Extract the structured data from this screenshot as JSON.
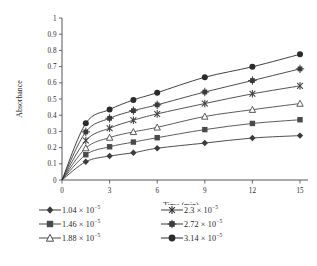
{
  "chart_data": {
    "type": "line",
    "title": "",
    "xlabel": "Time (min)",
    "ylabel": "Absorbance",
    "xlim": [
      0,
      15
    ],
    "ylim": [
      0,
      1
    ],
    "xticks": [
      "0",
      "3",
      "6",
      "9",
      "12",
      "15"
    ],
    "xtick_values": [
      0,
      3,
      6,
      9,
      12,
      15
    ],
    "yticks": [
      "0",
      "0.1",
      "0.2",
      "0.3",
      "0.4",
      "0.5",
      "0.6",
      "0.7",
      "0.8",
      "0.9",
      "1"
    ],
    "ytick_values": [
      0,
      0.1,
      0.2,
      0.3,
      0.4,
      0.5,
      0.6,
      0.7,
      0.8,
      0.9,
      1
    ],
    "grid": false,
    "legend_position": "below",
    "x": [
      0,
      1.5,
      3,
      4.5,
      6,
      9,
      12,
      15
    ],
    "series": [
      {
        "name": "1.04 × 10⁻⁵",
        "label_mantissa": "1.04 × 10",
        "label_exponent": "−5",
        "marker": "filled-diamond",
        "color": "#3b3b3b",
        "values": [
          0,
          0.113,
          0.148,
          0.168,
          0.196,
          0.228,
          0.259,
          0.274
        ]
      },
      {
        "name": "1.46 × 10⁻⁵",
        "label_mantissa": "1.46 × 10",
        "label_exponent": "−5",
        "marker": "filled-square",
        "color": "#4a4a4a",
        "values": [
          0,
          0.156,
          0.205,
          0.234,
          0.261,
          0.311,
          0.349,
          0.372
        ]
      },
      {
        "name": "1.88 × 10⁻⁵",
        "label_mantissa": "1.88 × 10",
        "label_exponent": "−5",
        "marker": "open-triangle",
        "color": "#4a4a4a",
        "values": [
          0,
          0.197,
          0.262,
          0.297,
          0.325,
          0.392,
          0.434,
          0.472
        ]
      },
      {
        "name": "2.3 × 10⁻⁵",
        "label_mantissa": "2.3 × 10",
        "label_exponent": "−5",
        "marker": "cross-star",
        "color": "#3f3f3f",
        "values": [
          0,
          0.244,
          0.32,
          0.369,
          0.408,
          0.472,
          0.532,
          0.581
        ]
      },
      {
        "name": "2.72 × 10⁻⁵",
        "label_mantissa": "2.72 × 10",
        "label_exponent": "−5",
        "marker": "square-star",
        "color": "#3a3a3a",
        "values": [
          0,
          0.297,
          0.381,
          0.428,
          0.464,
          0.543,
          0.614,
          0.686
        ]
      },
      {
        "name": "3.14 × 10⁻⁵",
        "label_mantissa": "3.14 × 10",
        "label_exponent": "−5",
        "marker": "filled-circle",
        "color": "#2b2b2b",
        "values": [
          0,
          0.35,
          0.435,
          0.494,
          0.539,
          0.634,
          0.699,
          0.776
        ]
      }
    ]
  }
}
